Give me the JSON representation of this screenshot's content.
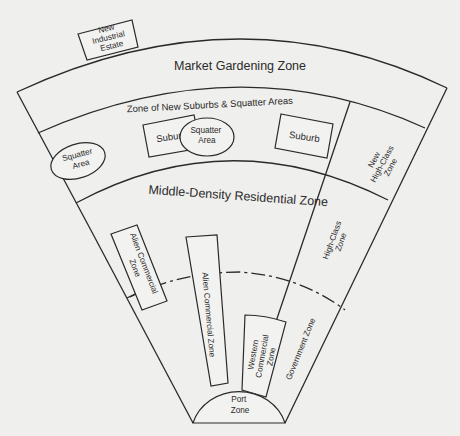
{
  "diagram": {
    "colors": {
      "background": "#efefed",
      "stroke": "#2a2a2a",
      "text": "#2a2a2a"
    },
    "zones": {
      "new_industrial_estate": [
        "New",
        "Industrial",
        "Estate"
      ],
      "market_gardening": "Market Gardening Zone",
      "new_suburbs_squatter": "Zone of New Suburbs & Squatter Areas",
      "squatter_area_1": [
        "Squatter",
        "Area"
      ],
      "suburb_1": "Suburb",
      "squatter_area_2": [
        "Squatter",
        "Area"
      ],
      "suburb_2": "Suburb",
      "new_high_class": [
        "New",
        "High-Class",
        "Zone"
      ],
      "middle_density": "Middle-Density Residential Zone",
      "alien_commercial_1": [
        "Alien Commercial",
        "Zone"
      ],
      "alien_commercial_2": "Alien Commercial Zone",
      "high_class": [
        "High-Class",
        "Zone"
      ],
      "western_commercial": [
        "Western",
        "Commercial",
        "Zone"
      ],
      "government": "Government Zone",
      "port": [
        "Port",
        "Zone"
      ]
    }
  }
}
